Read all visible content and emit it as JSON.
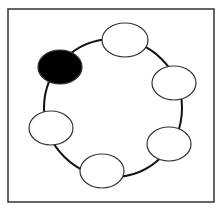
{
  "diagram": {
    "frame": {
      "x": 8,
      "y": 9,
      "width": 206,
      "height": 193,
      "stroke": "#333333"
    },
    "ring": {
      "cx": 113,
      "cy": 108,
      "r": 69,
      "stroke": "#111111"
    },
    "nodes": [
      {
        "id": "node-top",
        "cx": 125,
        "cy": 40,
        "rx": 23,
        "ry": 17,
        "fill": "#ffffff"
      },
      {
        "id": "node-right-upper",
        "cx": 174,
        "cy": 83,
        "rx": 22,
        "ry": 17,
        "fill": "#ffffff"
      },
      {
        "id": "node-right-lower",
        "cx": 169,
        "cy": 144,
        "rx": 22,
        "ry": 17,
        "fill": "#ffffff"
      },
      {
        "id": "node-bottom",
        "cx": 102,
        "cy": 171,
        "rx": 22,
        "ry": 17,
        "fill": "#ffffff"
      },
      {
        "id": "node-left",
        "cx": 51,
        "cy": 128,
        "rx": 22,
        "ry": 17,
        "fill": "#ffffff"
      },
      {
        "id": "node-highlighted",
        "cx": 60,
        "cy": 67,
        "rx": 22,
        "ry": 17,
        "fill": "#000000"
      }
    ]
  }
}
